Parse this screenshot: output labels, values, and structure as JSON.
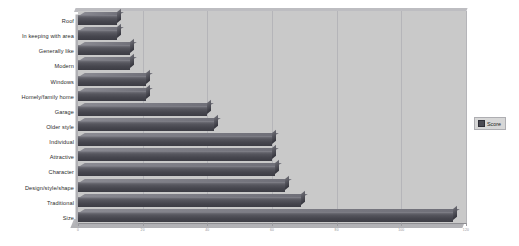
{
  "chart_data": {
    "type": "bar",
    "orientation": "horizontal",
    "title": "",
    "xlabel": "",
    "ylabel": "",
    "grid": true,
    "legend_position": "right",
    "xlim": [
      0,
      120
    ],
    "categories": [
      "Roof",
      "In keeping with area",
      "Generally like",
      "Modern",
      "Windows",
      "Homely/family home",
      "Garage",
      "Older style",
      "Individual",
      "Attractive",
      "Character",
      "Design/style/shape",
      "Traditional",
      "Size"
    ],
    "series": [
      {
        "name": "Score",
        "color": "#4a4a52",
        "values": [
          12,
          12,
          16,
          16,
          21,
          21,
          40,
          42,
          60,
          60,
          61,
          64,
          69,
          116
        ]
      }
    ],
    "xticks": [
      "0",
      "20",
      "40",
      "60",
      "80",
      "100",
      "120"
    ],
    "xtick_positions": [
      0,
      20,
      40,
      60,
      80,
      100,
      120
    ]
  },
  "legend": {
    "entries": [
      {
        "label": "Score",
        "color": "#4a4a52"
      }
    ]
  },
  "style": {
    "plot_background": "#c9c9c9",
    "page_background": "#ffffff",
    "gridline_color": "#b5b5b9",
    "axis_color": "#8e8e92",
    "label_color": "#2b2b2b"
  }
}
